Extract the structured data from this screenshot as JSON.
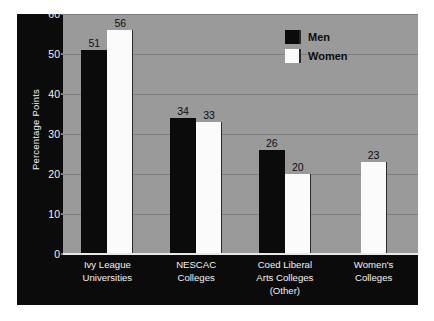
{
  "chart_data": {
    "type": "bar",
    "title": "",
    "xlabel": "",
    "ylabel": "Percentage Points",
    "ylim": [
      0,
      60
    ],
    "yticks": [
      0,
      10,
      20,
      30,
      40,
      50,
      60
    ],
    "grid": true,
    "legend_position": "top-right",
    "categories": [
      "Ivy League\nUniversities",
      "NESCAC\nColleges",
      "Coed Liberal\nArts Colleges\n(Other)",
      "Women's\nColleges"
    ],
    "series": [
      {
        "name": "Men",
        "color": "#0b0b0b",
        "values": [
          51,
          34,
          26,
          null
        ]
      },
      {
        "name": "Women",
        "color": "#fbfbfb",
        "values": [
          56,
          33,
          20,
          23
        ]
      }
    ],
    "data_labels": [
      {
        "group": 0,
        "series": "Men",
        "value": "51"
      },
      {
        "group": 0,
        "series": "Women",
        "value": "56"
      },
      {
        "group": 1,
        "series": "Men",
        "value": "34"
      },
      {
        "group": 1,
        "series": "Women",
        "value": "33"
      },
      {
        "group": 2,
        "series": "Men",
        "value": "26"
      },
      {
        "group": 2,
        "series": "Women",
        "value": "20"
      },
      {
        "group": 3,
        "series": "Women",
        "value": "23"
      }
    ]
  },
  "colors": {
    "panel_background": "#0b0b0b",
    "plot_background": "#9a9a9a",
    "gridline": "#7e7e7e",
    "axis_text": "#f2f2f2",
    "label_text": "#0e0e0e",
    "men_bar": "#0b0b0b",
    "women_bar": "#fbfbfb"
  }
}
